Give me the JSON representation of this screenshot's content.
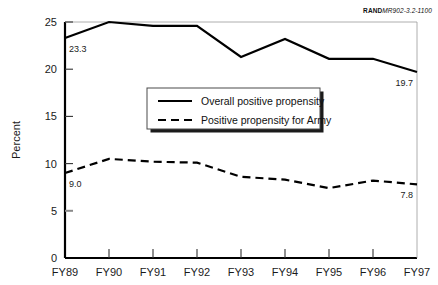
{
  "credit": {
    "mark": "RAND",
    "code": "MR902-3.2-1100"
  },
  "chart_data": {
    "type": "line",
    "title": "",
    "subtitle": "",
    "xlabel": "",
    "ylabel": "Percent",
    "categories": [
      "FY89",
      "FY90",
      "FY91",
      "FY92",
      "FY93",
      "FY94",
      "FY95",
      "FY96",
      "FY97"
    ],
    "ylim": [
      0,
      25
    ],
    "yticks": [
      0,
      5,
      10,
      15,
      20,
      25
    ],
    "ytick_labels": [
      "0",
      "5",
      "10",
      "15",
      "20",
      "25"
    ],
    "grid": false,
    "legend_position": "center",
    "series": [
      {
        "name": "Overall positive propensity",
        "style": "solid",
        "color": "#000000",
        "values": [
          23.3,
          25.0,
          24.6,
          24.6,
          21.3,
          23.2,
          21.1,
          21.1,
          19.7
        ]
      },
      {
        "name": "Positive propensity for Army",
        "style": "dashed",
        "color": "#000000",
        "values": [
          9.0,
          10.5,
          10.2,
          10.1,
          8.6,
          8.3,
          7.4,
          8.2,
          7.8
        ]
      }
    ],
    "annotations": [
      {
        "text": "23.3",
        "series": "Overall positive propensity",
        "category": "FY89"
      },
      {
        "text": "19.7",
        "series": "Overall positive propensity",
        "category": "FY97"
      },
      {
        "text": "9.0",
        "series": "Positive propensity for Army",
        "category": "FY89"
      },
      {
        "text": "7.8",
        "series": "Positive propensity for Army",
        "category": "FY97"
      }
    ]
  },
  "legend": {
    "items": [
      {
        "label": "Overall positive propensity",
        "style": "solid"
      },
      {
        "label": "Positive propensity for Army",
        "style": "dashed"
      }
    ]
  }
}
